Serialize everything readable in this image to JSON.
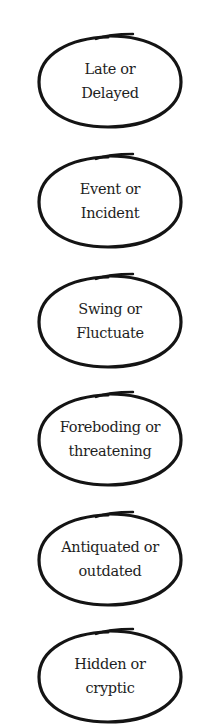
{
  "bubbles": [
    {
      "line1": "Late or",
      "line2": "Delayed",
      "top": 32
    },
    {
      "line1": "Event or",
      "line2": "Incident",
      "top": 152
    },
    {
      "line1": "Swing or",
      "line2": "Fluctuate",
      "top": 272
    },
    {
      "line1": "Foreboding or",
      "line2": "threatening",
      "top": 390
    },
    {
      "line1": "Antiquated or",
      "line2": "outdated",
      "top": 510
    },
    {
      "line1": "Hidden or",
      "line2": "cryptic",
      "top": 627
    }
  ],
  "colors": {
    "stroke": "#141414",
    "text": "#1e1e1e",
    "background": "#ffffff"
  }
}
